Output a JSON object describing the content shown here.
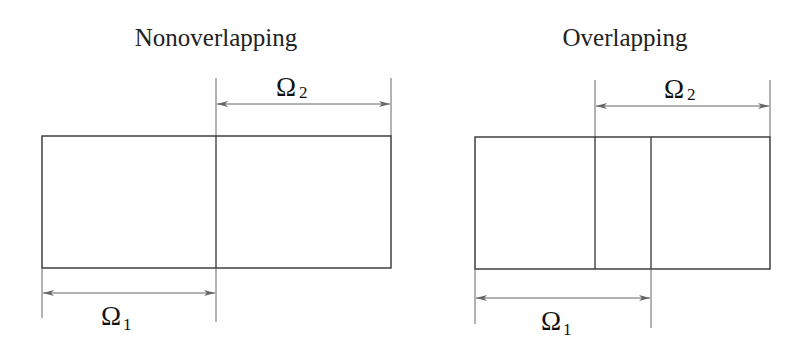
{
  "diagrams": {
    "nonoverlapping": {
      "title": "Nonoverlapping",
      "omega2": {
        "symbol": "Ω",
        "subscript": "2"
      },
      "omega1": {
        "symbol": "Ω",
        "subscript": "1"
      }
    },
    "overlapping": {
      "title": "Overlapping",
      "omega2": {
        "symbol": "Ω",
        "subscript": "2"
      },
      "omega1": {
        "symbol": "Ω",
        "subscript": "1"
      }
    }
  },
  "colors": {
    "line": "#333333",
    "dimension": "#666666",
    "text": "#222222"
  }
}
